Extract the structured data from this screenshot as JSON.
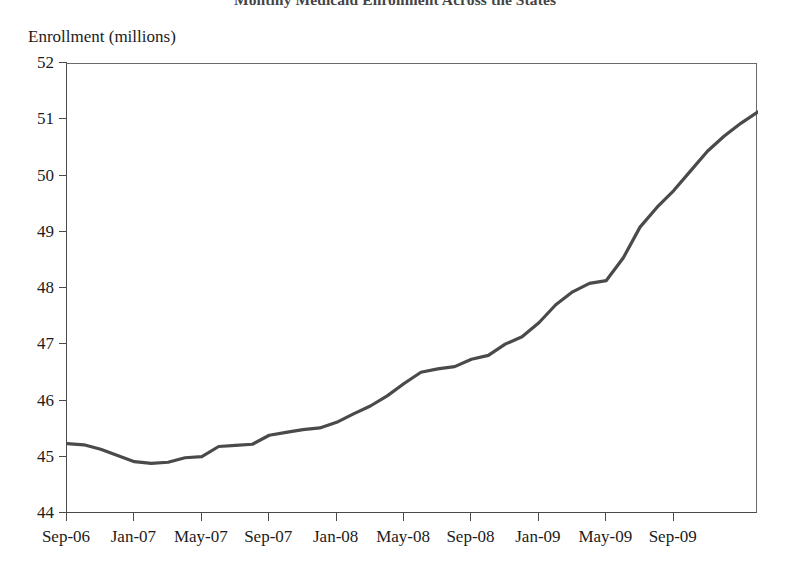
{
  "chart_data": {
    "type": "line",
    "title": "Monthly Medicaid Enrollment Across the States",
    "xlabel": "",
    "ylabel": "Enrollment (millions)",
    "ylim": [
      44,
      52
    ],
    "xlim": [
      "Sep-06",
      "Sep-09"
    ],
    "grid": false,
    "legend": null,
    "y_ticks": [
      "44",
      "45",
      "46",
      "47",
      "48",
      "49",
      "50",
      "51",
      "52"
    ],
    "y_tick_values": [
      44,
      45,
      46,
      47,
      48,
      49,
      50,
      51,
      52
    ],
    "x_ticks": [
      "Sep-06",
      "Jan-07",
      "May-07",
      "Sep-07",
      "Jan-08",
      "May-08",
      "Sep-08",
      "Jan-09",
      "May-09",
      "Sep-09"
    ],
    "x_tick_months": [
      0,
      4,
      8,
      12,
      16,
      20,
      24,
      28,
      32,
      36
    ],
    "series_name": "Medicaid enrollment",
    "line_color": "#4a4a4a",
    "x": [
      "Sep-06",
      "Oct-06",
      "Nov-06",
      "Dec-06",
      "Jan-07",
      "Feb-07",
      "Mar-07",
      "Apr-07",
      "May-07",
      "Jun-07",
      "Jul-07",
      "Aug-07",
      "Sep-07",
      "Oct-07",
      "Nov-07",
      "Dec-07",
      "Jan-08",
      "Feb-08",
      "Mar-08",
      "Apr-08",
      "May-08",
      "Jun-08",
      "Jul-08",
      "Aug-08",
      "Sep-08",
      "Oct-08",
      "Nov-08",
      "Dec-08",
      "Jan-09",
      "Feb-09",
      "Mar-09",
      "Apr-09",
      "May-09",
      "Jun-09",
      "Jul-09",
      "Aug-09",
      "Sep-09"
    ],
    "values": [
      45.25,
      45.22,
      45.13,
      45.02,
      44.92,
      44.9,
      44.93,
      45.0,
      45.02,
      45.2,
      45.22,
      45.25,
      45.4,
      45.45,
      45.5,
      45.52,
      45.62,
      45.78,
      45.9,
      46.08,
      46.3,
      46.5,
      46.58,
      46.6,
      46.72,
      46.78,
      47.0,
      47.12,
      47.35,
      47.62,
      47.85,
      48.05,
      48.12,
      48.45,
      48.9,
      49.2,
      49.5
    ],
    "values_tail_note": "series continues to Sep-09",
    "full_values": [
      45.25,
      45.22,
      45.13,
      45.02,
      44.92,
      44.9,
      44.93,
      45.0,
      45.02,
      45.2,
      45.22,
      45.25,
      45.4,
      45.45,
      45.5,
      45.52,
      45.62,
      45.78,
      45.9,
      46.08,
      46.3,
      46.5,
      46.58,
      46.6,
      46.72,
      46.78,
      47.0,
      47.12,
      47.35,
      47.62,
      47.85,
      48.05,
      48.12,
      48.45,
      48.9,
      49.2,
      51.15
    ],
    "points": [
      {
        "month": "Sep-06",
        "i": 0,
        "v": 45.25
      },
      {
        "month": "Oct-06",
        "i": 1,
        "v": 45.23
      },
      {
        "month": "Nov-06",
        "i": 2,
        "v": 45.15
      },
      {
        "month": "Dec-06",
        "i": 3,
        "v": 45.04
      },
      {
        "month": "Jan-07",
        "i": 4,
        "v": 44.93
      },
      {
        "month": "Feb-07",
        "i": 5,
        "v": 44.9
      },
      {
        "month": "Mar-07",
        "i": 6,
        "v": 44.92
      },
      {
        "month": "Apr-07",
        "i": 7,
        "v": 45.0
      },
      {
        "month": "May-07",
        "i": 8,
        "v": 45.02
      },
      {
        "month": "Jun-07",
        "i": 9,
        "v": 45.2
      },
      {
        "month": "Jul-07",
        "i": 10,
        "v": 45.22
      },
      {
        "month": "Aug-07",
        "i": 11,
        "v": 45.24
      },
      {
        "month": "Sep-07",
        "i": 12,
        "v": 45.4
      },
      {
        "month": "Oct-07",
        "i": 13,
        "v": 45.45
      },
      {
        "month": "Nov-07",
        "i": 14,
        "v": 45.5
      },
      {
        "month": "Dec-07",
        "i": 15,
        "v": 45.53
      },
      {
        "month": "Jan-08",
        "i": 16,
        "v": 45.63
      },
      {
        "month": "Feb-08",
        "i": 17,
        "v": 45.78
      },
      {
        "month": "Mar-08",
        "i": 18,
        "v": 45.92
      },
      {
        "month": "Apr-08",
        "i": 19,
        "v": 46.1
      },
      {
        "month": "May-08",
        "i": 20,
        "v": 46.32
      },
      {
        "month": "Jun-08",
        "i": 21,
        "v": 46.52
      },
      {
        "month": "Jul-08",
        "i": 22,
        "v": 46.58
      },
      {
        "month": "Aug-08",
        "i": 23,
        "v": 46.62
      },
      {
        "month": "Sep-08",
        "i": 24,
        "v": 46.75
      },
      {
        "month": "Oct-08",
        "i": 25,
        "v": 46.82
      },
      {
        "month": "Nov-08",
        "i": 26,
        "v": 47.02
      },
      {
        "month": "Dec-08",
        "i": 27,
        "v": 47.15
      },
      {
        "month": "Jan-09",
        "i": 28,
        "v": 47.4
      },
      {
        "month": "Feb-09",
        "i": 29,
        "v": 47.72
      },
      {
        "month": "Mar-09",
        "i": 30,
        "v": 47.95
      },
      {
        "month": "Apr-09",
        "i": 31,
        "v": 48.1
      },
      {
        "month": "May-09",
        "i": 32,
        "v": 48.15
      },
      {
        "month": "Jun-09",
        "i": 33,
        "v": 48.55
      },
      {
        "month": "Jul-09",
        "i": 34,
        "v": 49.1
      },
      {
        "month": "Aug-09",
        "i": 35,
        "v": 49.45
      },
      {
        "month": "Sep-09",
        "i": 36,
        "v": 49.75
      },
      {
        "month": "Oct-09",
        "i": 37,
        "v": 50.1
      },
      {
        "month": "Nov-09",
        "i": 38,
        "v": 50.45
      },
      {
        "month": "Dec-09",
        "i": 39,
        "v": 50.72
      },
      {
        "month": "Jan-10",
        "i": 40,
        "v": 50.95
      },
      {
        "month": "Feb-10",
        "i": 41,
        "v": 51.15
      }
    ],
    "annotations": [],
    "min_value": 44.9,
    "max_value": 51.15,
    "start_value": 45.25,
    "end_value": 51.15
  }
}
